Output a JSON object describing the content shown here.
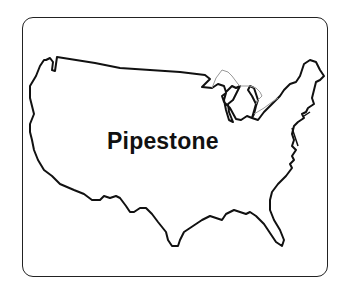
{
  "map": {
    "region": "United States (contiguous)",
    "label": "Pipestone",
    "outline_color": "#111111",
    "lakes_color": "#999999",
    "background": "#ffffff"
  }
}
